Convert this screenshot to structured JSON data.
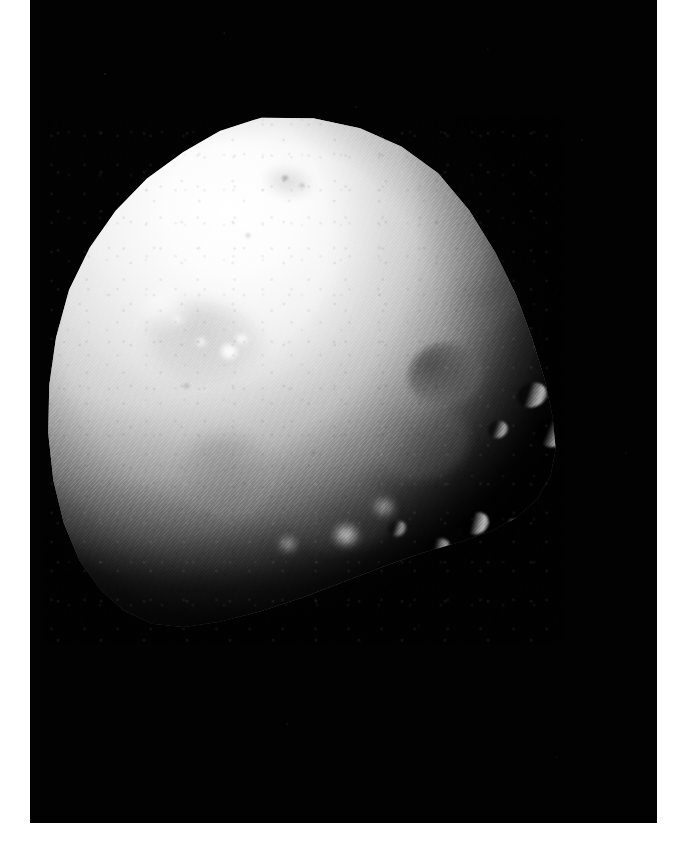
{
  "image": {
    "subject": "Deimos",
    "subject_type": "moon",
    "parent_body": "Mars",
    "capture_style": "grayscale spacecraft photograph",
    "orientation": "illuminated from upper-left, terminator across lower-right",
    "background_color": "#020202",
    "page_color": "#ffffff",
    "surface_highlight_color": "#ffffff",
    "surface_midtone_color": "#d2d2d2",
    "surface_shadow_color": "#4a4a4a",
    "photo_frame": {
      "left": 30,
      "top": 0,
      "width": 627,
      "height": 823
    },
    "body_bounds": {
      "left": 43,
      "top": 115,
      "width": 520,
      "height": 530
    },
    "texture": "diagonal raster scan lines",
    "alt_text": "Irregular, roughly triangular grey moon Deimos, brightly lit at upper left and fading into black shadow at lower right, set against empty black space."
  },
  "features": [
    {
      "name": "crater-dark-major",
      "class": "crater-dark",
      "left": 365,
      "top": 228,
      "width": 74,
      "height": 64,
      "rotate": -12,
      "blur": 3.0,
      "opacity": 1.0
    },
    {
      "name": "crater-soft-upper-right",
      "class": "smudge",
      "left": 404,
      "top": 148,
      "width": 88,
      "height": 60,
      "rotate": -28,
      "blur": 6.5,
      "opacity": 0.85
    },
    {
      "name": "crater-soft-central",
      "class": "crater-soft",
      "left": 330,
      "top": 290,
      "width": 96,
      "height": 74,
      "rotate": -8,
      "blur": 6.0,
      "opacity": 0.9
    },
    {
      "name": "crater-soft-lower-left",
      "class": "crater-soft",
      "left": 136,
      "top": 318,
      "width": 96,
      "height": 84,
      "rotate": 10,
      "blur": 6.5,
      "opacity": 0.95
    },
    {
      "name": "crater-soft-left-upper",
      "class": "crater-soft",
      "left": 104,
      "top": 188,
      "width": 118,
      "height": 86,
      "rotate": 14,
      "blur": 7.5,
      "opacity": 0.8
    },
    {
      "name": "crater-soft-mid-low",
      "class": "crater-soft",
      "left": 246,
      "top": 366,
      "width": 104,
      "height": 70,
      "rotate": -6,
      "blur": 7.0,
      "opacity": 0.7
    },
    {
      "name": "crater-rim-north",
      "class": "crater-rim",
      "left": 474,
      "top": 268,
      "width": 30,
      "height": 24,
      "rotate": -20,
      "blur": 1.2,
      "opacity": 0.85
    },
    {
      "name": "crater-rim-east-a",
      "class": "crater-rim",
      "left": 493,
      "top": 302,
      "width": 34,
      "height": 30,
      "rotate": -16,
      "blur": 1.0,
      "opacity": 0.95
    },
    {
      "name": "crater-rim-east-b",
      "class": "crater-rim",
      "left": 445,
      "top": 306,
      "width": 20,
      "height": 17,
      "rotate": -18,
      "blur": 1.0,
      "opacity": 0.75
    },
    {
      "name": "crater-rim-terminator-a",
      "class": "crater-rim",
      "left": 420,
      "top": 398,
      "width": 26,
      "height": 21,
      "rotate": -24,
      "blur": 1.2,
      "opacity": 0.9
    },
    {
      "name": "crater-rim-terminator-b",
      "class": "crater-rim",
      "left": 455,
      "top": 404,
      "width": 22,
      "height": 18,
      "rotate": -22,
      "blur": 1.2,
      "opacity": 0.85
    },
    {
      "name": "crater-rim-terminator-c",
      "class": "crater-rim",
      "left": 383,
      "top": 424,
      "width": 24,
      "height": 19,
      "rotate": -26,
      "blur": 1.4,
      "opacity": 0.8
    },
    {
      "name": "crater-rim-terminator-d",
      "class": "crater-rim",
      "left": 345,
      "top": 406,
      "width": 18,
      "height": 15,
      "rotate": -20,
      "blur": 1.4,
      "opacity": 0.7
    },
    {
      "name": "bright-spot-primary",
      "class": "bright",
      "left": 176,
      "top": 228,
      "width": 20,
      "height": 17,
      "rotate": 0,
      "blur": 2.0,
      "opacity": 1.0
    },
    {
      "name": "bright-spot-secondary",
      "class": "bright",
      "left": 192,
      "top": 218,
      "width": 14,
      "height": 12,
      "rotate": 0,
      "blur": 2.0,
      "opacity": 0.85
    },
    {
      "name": "bright-spot-tertiary",
      "class": "bright",
      "left": 152,
      "top": 222,
      "width": 12,
      "height": 10,
      "rotate": 0,
      "blur": 2.2,
      "opacity": 0.8
    },
    {
      "name": "bright-spot-upper",
      "class": "bright",
      "left": 129,
      "top": 200,
      "width": 11,
      "height": 9,
      "rotate": 0,
      "blur": 2.4,
      "opacity": 0.7
    },
    {
      "name": "bright-spot-ray-patch",
      "class": "bright",
      "left": 96,
      "top": 176,
      "width": 54,
      "height": 34,
      "rotate": 28,
      "blur": 8.0,
      "opacity": 0.55
    },
    {
      "name": "bright-spot-lower-mid",
      "class": "bright",
      "left": 290,
      "top": 410,
      "width": 26,
      "height": 20,
      "rotate": 0,
      "blur": 4.0,
      "opacity": 0.75
    },
    {
      "name": "bright-spot-lower-left",
      "class": "bright",
      "left": 236,
      "top": 422,
      "width": 18,
      "height": 14,
      "rotate": 0,
      "blur": 4.0,
      "opacity": 0.6
    },
    {
      "name": "bright-spot-lower-rim",
      "class": "bright",
      "left": 330,
      "top": 384,
      "width": 22,
      "height": 16,
      "rotate": 0,
      "blur": 4.5,
      "opacity": 0.55
    },
    {
      "name": "smudge-summit",
      "class": "smudge",
      "left": 221,
      "top": 52,
      "width": 48,
      "height": 30,
      "rotate": 12,
      "blur": 5.0,
      "opacity": 0.55
    },
    {
      "name": "pit-summit-a",
      "class": "pit",
      "left": 238,
      "top": 60,
      "width": 8,
      "height": 6,
      "rotate": 0,
      "blur": 1.2,
      "opacity": 0.6
    },
    {
      "name": "pit-summit-b",
      "class": "pit",
      "left": 256,
      "top": 68,
      "width": 6,
      "height": 5,
      "rotate": 0,
      "blur": 1.2,
      "opacity": 0.5
    },
    {
      "name": "pit-upper-centre",
      "class": "pit",
      "left": 202,
      "top": 118,
      "width": 6,
      "height": 5,
      "rotate": 0,
      "blur": 1.4,
      "opacity": 0.45
    },
    {
      "name": "pit-left-mid",
      "class": "pit",
      "left": 140,
      "top": 268,
      "width": 7,
      "height": 6,
      "rotate": 0,
      "blur": 1.4,
      "opacity": 0.45
    },
    {
      "name": "pit-centre-low",
      "class": "pit",
      "left": 268,
      "top": 336,
      "width": 6,
      "height": 5,
      "rotate": 0,
      "blur": 1.4,
      "opacity": 0.4
    },
    {
      "name": "pit-lower-left",
      "class": "pit",
      "left": 160,
      "top": 396,
      "width": 7,
      "height": 6,
      "rotate": 0,
      "blur": 1.5,
      "opacity": 0.4
    }
  ]
}
